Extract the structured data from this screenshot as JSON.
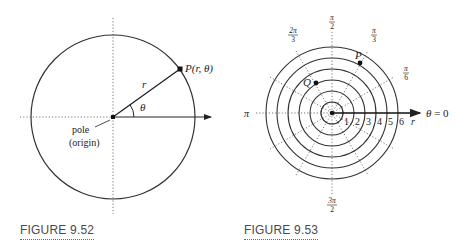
{
  "figures": [
    {
      "id": "fig-9-52",
      "caption": "FIGURE 9.52",
      "labels": {
        "point": "P(r, θ)",
        "point_name": "P",
        "point_args": "(r, θ)",
        "radius": "r",
        "angle": "θ",
        "pole_line1": "pole",
        "pole_line2": "(origin)"
      },
      "colors": {
        "stroke": "#333333",
        "dotted": "#777777"
      }
    },
    {
      "id": "fig-9-53",
      "caption": "FIGURE 9.53",
      "labels": {
        "angle_pi_over_2": {
          "num": "π",
          "den": "2"
        },
        "angle_2pi_over_3": {
          "num": "2π",
          "den": "3"
        },
        "angle_pi_over_3": {
          "num": "π",
          "den": "3"
        },
        "angle_pi_over_6": {
          "num": "π",
          "den": "6"
        },
        "angle_pi": "π",
        "angle_3pi_over_2": {
          "num": "3π",
          "den": "2"
        },
        "polar_axis": "θ = 0",
        "radius_axis": "r",
        "point_p": "P",
        "point_q": "Q"
      },
      "ring_numbers": [
        "1",
        "2",
        "3",
        "4",
        "5",
        "6"
      ],
      "colors": {
        "stroke": "#333333",
        "dotted": "#777777"
      }
    }
  ]
}
